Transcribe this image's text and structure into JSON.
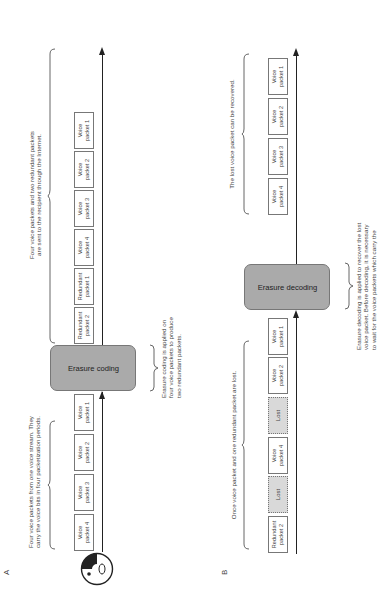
{
  "diagram": {
    "panels": [
      {
        "label": "A",
        "caption_input": "Four voice packets from one voice stream. They carry the voice bits in four packetization periods.",
        "caption_input_lines": [
          "Four voice packets from one voice stream. They",
          "carry the voice bits in four packetization periods."
        ],
        "input_packets": [
          {
            "line1": "Voice",
            "line2": "packet 4"
          },
          {
            "line1": "Voice",
            "line2": "packet 3"
          },
          {
            "line1": "Voice",
            "line2": "packet 2"
          },
          {
            "line1": "Voice",
            "line2": "packet 1"
          }
        ],
        "process_label": "Erasure coding",
        "process_caption_lines": [
          "Erasure coding is applied on",
          "four voice packets to produce",
          "two redundant packets."
        ],
        "output_packets": [
          {
            "line1": "Redundant",
            "line2": "packet 2"
          },
          {
            "line1": "Redundant",
            "line2": "packet 1"
          },
          {
            "line1": "Voice",
            "line2": "packet 4"
          },
          {
            "line1": "Voice",
            "line2": "packet 3"
          },
          {
            "line1": "Voice",
            "line2": "packet 2"
          },
          {
            "line1": "Voice",
            "line2": "packet 1"
          }
        ],
        "caption_output_lines": [
          "Four voice packets and two redundant packets",
          "are sent to the recipient through the Internet."
        ]
      },
      {
        "label": "B",
        "caption_input_lines": [
          "Once voice packet and one redundant packet are lost."
        ],
        "input_packets": [
          {
            "line1": "Redundant",
            "line2": "packet 2",
            "lost": false
          },
          {
            "line1": "Lost",
            "line2": "",
            "lost": true
          },
          {
            "line1": "Voice",
            "line2": "packet 4",
            "lost": false
          },
          {
            "line1": "Lost",
            "line2": "",
            "lost": true
          },
          {
            "line1": "Voice",
            "line2": "packet 2",
            "lost": false
          },
          {
            "line1": "Voice",
            "line2": "packet 1",
            "lost": false
          }
        ],
        "process_label": "Erasure decoding",
        "process_caption_lines": [
          "Erasure decoding is applied to recover the lost",
          "voice packet. Before decoding, it is necessary",
          "to wait for the voice packets which carry the"
        ],
        "output_packets": [
          {
            "line1": "Voice",
            "line2": "packet 4"
          },
          {
            "line1": "Voice",
            "line2": "packet 3"
          },
          {
            "line1": "Voice",
            "line2": "packet 2"
          },
          {
            "line1": "Voice",
            "line2": "packet 1"
          }
        ],
        "caption_output_lines": [
          "The lost voice packet can be recovered."
        ]
      }
    ],
    "icons": {
      "speaker": "face-icon"
    }
  }
}
